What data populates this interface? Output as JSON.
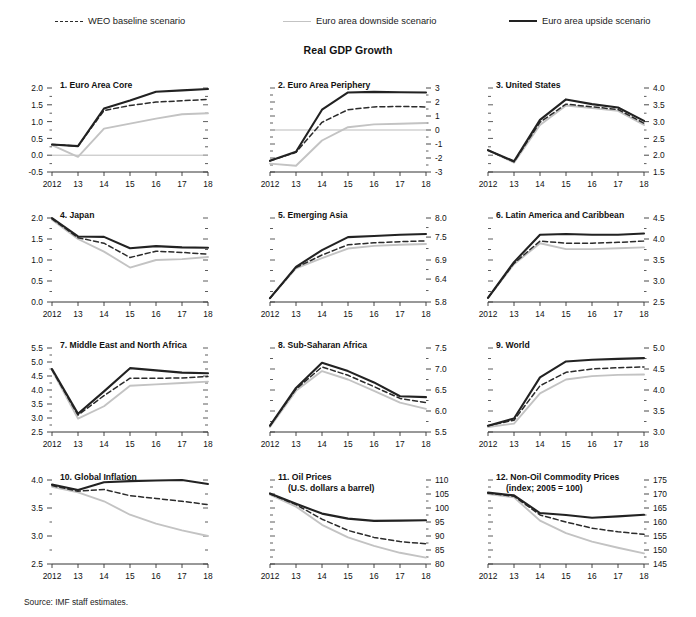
{
  "figure": {
    "title": "Real GDP Growth",
    "source": "Source: IMF staff estimates."
  },
  "legend": {
    "items": [
      {
        "label": "WEO baseline scenario",
        "style": "dashed",
        "color": "#2b2b2b"
      },
      {
        "label": "Euro area downside scenario",
        "style": "solid-light",
        "color": "#c3c3c3"
      },
      {
        "label": "Euro area upside scenario",
        "style": "solid-bold",
        "color": "#222222"
      }
    ]
  },
  "colors": {
    "baseline": "#2b2b2b",
    "downside": "#c3c3c3",
    "upside": "#222222",
    "axis": "#333333",
    "zeroline": "#bbbbbb"
  },
  "chart_data": [
    {
      "type": "line",
      "panel": 1,
      "title": "1. Euro Area Core",
      "subtitle": "",
      "x": [
        "2012",
        "13",
        "14",
        "15",
        "16",
        "17",
        "18"
      ],
      "xlabel": "",
      "ylabel": "",
      "ylim": [
        -0.5,
        2.0
      ],
      "yticks": [
        -0.5,
        0.0,
        0.5,
        1.0,
        1.5,
        2.0
      ],
      "ytick_labels": [
        "-0.5",
        "0.0",
        "0.5",
        "1.0",
        "1.5",
        "2.0"
      ],
      "axis_side": "left",
      "zero_line": 0.0,
      "grid": false,
      "series": [
        {
          "name": "Euro area upside scenario",
          "key": "upside",
          "values": [
            0.32,
            0.27,
            1.39,
            1.63,
            1.89,
            1.93,
            1.97
          ]
        },
        {
          "name": "WEO baseline scenario",
          "key": "baseline",
          "values": [
            0.32,
            0.27,
            1.33,
            1.48,
            1.58,
            1.62,
            1.66
          ]
        },
        {
          "name": "Euro area downside scenario",
          "key": "downside",
          "values": [
            0.3,
            -0.05,
            0.79,
            0.94,
            1.09,
            1.22,
            1.25
          ]
        }
      ]
    },
    {
      "type": "line",
      "panel": 2,
      "title": "2. Euro Area Periphery",
      "subtitle": "",
      "x": [
        "2012",
        "13",
        "14",
        "15",
        "16",
        "17",
        "18"
      ],
      "xlabel": "",
      "ylabel": "",
      "ylim": [
        -3,
        3
      ],
      "yticks": [
        -3,
        -2,
        -1,
        0,
        1,
        2,
        3
      ],
      "ytick_labels": [
        "-3",
        "-2",
        "-1",
        "0",
        "1",
        "2",
        "3"
      ],
      "axis_side": "right",
      "zero_line": 0,
      "grid": false,
      "series": [
        {
          "name": "Euro area upside scenario",
          "key": "upside",
          "values": [
            -2.2,
            -1.55,
            1.45,
            2.68,
            2.72,
            2.7,
            2.68
          ]
        },
        {
          "name": "WEO baseline scenario",
          "key": "baseline",
          "values": [
            -2.2,
            -1.6,
            0.55,
            1.45,
            1.65,
            1.68,
            1.65
          ]
        },
        {
          "name": "Euro area downside scenario",
          "key": "downside",
          "values": [
            -2.4,
            -2.55,
            -0.75,
            0.2,
            0.4,
            0.45,
            0.5
          ]
        }
      ]
    },
    {
      "type": "line",
      "panel": 3,
      "title": "3. United States",
      "subtitle": "",
      "x": [
        "2012",
        "13",
        "14",
        "15",
        "16",
        "17",
        "18"
      ],
      "xlabel": "",
      "ylabel": "",
      "ylim": [
        1.5,
        4.0
      ],
      "yticks": [
        1.5,
        2.0,
        2.5,
        3.0,
        3.5,
        4.0
      ],
      "ytick_labels": [
        "1.5",
        "2.0",
        "2.5",
        "3.0",
        "3.5",
        "4.0"
      ],
      "axis_side": "right",
      "zero_line": null,
      "grid": false,
      "series": [
        {
          "name": "Euro area upside scenario",
          "key": "upside",
          "values": [
            2.15,
            1.82,
            3.05,
            3.66,
            3.52,
            3.42,
            3.02
          ]
        },
        {
          "name": "WEO baseline scenario",
          "key": "baseline",
          "values": [
            2.15,
            1.8,
            2.98,
            3.52,
            3.44,
            3.36,
            2.95
          ]
        },
        {
          "name": "Euro area downside scenario",
          "key": "downside",
          "values": [
            2.15,
            1.78,
            2.9,
            3.48,
            3.4,
            3.32,
            2.9
          ]
        }
      ]
    },
    {
      "type": "line",
      "panel": 4,
      "title": "4. Japan",
      "subtitle": "",
      "x": [
        "2012",
        "13",
        "14",
        "15",
        "16",
        "17",
        "18"
      ],
      "xlabel": "",
      "ylabel": "",
      "ylim": [
        0.0,
        2.0
      ],
      "yticks": [
        0.0,
        0.5,
        1.0,
        1.5,
        2.0
      ],
      "ytick_labels": [
        "0.0",
        "0.5",
        "1.0",
        "1.5",
        "2.0"
      ],
      "axis_side": "left",
      "zero_line": null,
      "grid": false,
      "series": [
        {
          "name": "Euro area upside scenario",
          "key": "upside",
          "values": [
            2.0,
            1.56,
            1.55,
            1.28,
            1.33,
            1.3,
            1.29
          ]
        },
        {
          "name": "WEO baseline scenario",
          "key": "baseline",
          "values": [
            1.98,
            1.53,
            1.4,
            1.06,
            1.21,
            1.18,
            1.14
          ]
        },
        {
          "name": "Euro area downside scenario",
          "key": "downside",
          "values": [
            1.96,
            1.5,
            1.2,
            0.82,
            1.0,
            1.02,
            1.07
          ]
        }
      ]
    },
    {
      "type": "line",
      "panel": 5,
      "title": "5. Emerging Asia",
      "subtitle": "",
      "x": [
        "2012",
        "13",
        "14",
        "15",
        "16",
        "17",
        "18"
      ],
      "xlabel": "",
      "ylabel": "",
      "ylim": [
        5.8,
        8.0
      ],
      "yticks": [
        5.8,
        6.4,
        6.9,
        7.5,
        8.0
      ],
      "ytick_labels": [
        "5.8",
        "6.4",
        "6.9",
        "7.5",
        "8.0"
      ],
      "axis_side": "right",
      "zero_line": null,
      "grid": false,
      "series": [
        {
          "name": "Euro area upside scenario",
          "key": "upside",
          "values": [
            5.9,
            6.72,
            7.16,
            7.5,
            7.53,
            7.56,
            7.58
          ]
        },
        {
          "name": "WEO baseline scenario",
          "key": "baseline",
          "values": [
            5.9,
            6.7,
            7.03,
            7.3,
            7.35,
            7.38,
            7.4
          ]
        },
        {
          "name": "Euro area downside scenario",
          "key": "downside",
          "values": [
            5.9,
            6.68,
            6.95,
            7.2,
            7.27,
            7.3,
            7.32
          ]
        }
      ]
    },
    {
      "type": "line",
      "panel": 6,
      "title": "6. Latin America and Caribbean",
      "subtitle": "",
      "x": [
        "2012",
        "13",
        "14",
        "15",
        "16",
        "17",
        "18"
      ],
      "xlabel": "",
      "ylabel": "",
      "ylim": [
        2.5,
        4.5
      ],
      "yticks": [
        2.5,
        3.0,
        3.5,
        4.0,
        4.5
      ],
      "ytick_labels": [
        "2.5",
        "3.0",
        "3.5",
        "4.0",
        "4.5"
      ],
      "axis_side": "right",
      "zero_line": null,
      "grid": false,
      "series": [
        {
          "name": "Euro area upside scenario",
          "key": "upside",
          "values": [
            2.6,
            3.45,
            4.1,
            4.12,
            4.1,
            4.1,
            4.13
          ]
        },
        {
          "name": "WEO baseline scenario",
          "key": "baseline",
          "values": [
            2.6,
            3.42,
            3.95,
            3.9,
            3.9,
            3.92,
            3.95
          ]
        },
        {
          "name": "Euro area downside scenario",
          "key": "downside",
          "values": [
            2.6,
            3.4,
            3.9,
            3.76,
            3.76,
            3.78,
            3.8
          ]
        }
      ]
    },
    {
      "type": "line",
      "panel": 7,
      "title": "7. Middle East and North Africa",
      "subtitle": "",
      "x": [
        "2012",
        "13",
        "14",
        "15",
        "16",
        "17",
        "18"
      ],
      "xlabel": "",
      "ylabel": "",
      "ylim": [
        2.5,
        5.5
      ],
      "yticks": [
        2.5,
        3.0,
        3.5,
        4.0,
        4.5,
        5.0,
        5.5
      ],
      "ytick_labels": [
        "2.5",
        "3.0",
        "3.5",
        "4.0",
        "4.5",
        "5.0",
        "5.5"
      ],
      "axis_side": "left",
      "zero_line": null,
      "grid": false,
      "series": [
        {
          "name": "Euro area upside scenario",
          "key": "upside",
          "values": [
            4.75,
            3.15,
            3.95,
            4.78,
            4.7,
            4.62,
            4.6
          ]
        },
        {
          "name": "WEO baseline scenario",
          "key": "baseline",
          "values": [
            4.72,
            3.1,
            3.8,
            4.42,
            4.42,
            4.43,
            4.48
          ]
        },
        {
          "name": "Euro area downside scenario",
          "key": "downside",
          "values": [
            4.7,
            2.98,
            3.42,
            4.15,
            4.2,
            4.25,
            4.3
          ]
        }
      ]
    },
    {
      "type": "line",
      "panel": 8,
      "title": "8. Sub-Saharan Africa",
      "subtitle": "",
      "x": [
        "2012",
        "13",
        "14",
        "15",
        "16",
        "17",
        "18"
      ],
      "xlabel": "",
      "ylabel": "",
      "ylim": [
        5.5,
        7.5
      ],
      "yticks": [
        5.5,
        6.0,
        6.5,
        7.0,
        7.5
      ],
      "ytick_labels": [
        "5.5",
        "6.0",
        "6.5",
        "7.0",
        "7.5"
      ],
      "axis_side": "right",
      "zero_line": null,
      "grid": false,
      "series": [
        {
          "name": "Euro area upside scenario",
          "key": "upside",
          "values": [
            5.65,
            6.55,
            7.15,
            6.95,
            6.68,
            6.35,
            6.33
          ]
        },
        {
          "name": "WEO baseline scenario",
          "key": "baseline",
          "values": [
            5.65,
            6.52,
            7.05,
            6.85,
            6.58,
            6.3,
            6.2
          ]
        },
        {
          "name": "Euro area downside scenario",
          "key": "downside",
          "values": [
            5.62,
            6.48,
            6.95,
            6.75,
            6.48,
            6.2,
            6.05
          ]
        }
      ]
    },
    {
      "type": "line",
      "panel": 9,
      "title": "9. World",
      "subtitle": "",
      "x": [
        "2012",
        "13",
        "14",
        "15",
        "16",
        "17",
        "18"
      ],
      "xlabel": "",
      "ylabel": "",
      "ylim": [
        3.0,
        5.0
      ],
      "yticks": [
        3.0,
        3.5,
        4.0,
        4.5,
        5.0
      ],
      "ytick_labels": [
        "3.0",
        "3.5",
        "4.0",
        "4.5",
        "5.0"
      ],
      "axis_side": "right",
      "zero_line": null,
      "grid": false,
      "series": [
        {
          "name": "Euro area upside scenario",
          "key": "upside",
          "values": [
            3.15,
            3.32,
            4.3,
            4.68,
            4.72,
            4.74,
            4.76
          ]
        },
        {
          "name": "WEO baseline scenario",
          "key": "baseline",
          "values": [
            3.15,
            3.28,
            4.1,
            4.42,
            4.5,
            4.53,
            4.55
          ]
        },
        {
          "name": "Euro area downside scenario",
          "key": "downside",
          "values": [
            3.12,
            3.2,
            3.92,
            4.25,
            4.33,
            4.36,
            4.37
          ]
        }
      ]
    },
    {
      "type": "line",
      "panel": 10,
      "title": "10. Global Inflation",
      "subtitle": "",
      "x": [
        "2012",
        "13",
        "14",
        "15",
        "16",
        "17",
        "18"
      ],
      "xlabel": "",
      "ylabel": "",
      "ylim": [
        2.5,
        4.0
      ],
      "yticks": [
        2.5,
        3.0,
        3.5,
        4.0
      ],
      "ytick_labels": [
        "2.5",
        "3.0",
        "3.5",
        "4.0"
      ],
      "axis_side": "left",
      "zero_line": null,
      "grid": false,
      "series": [
        {
          "name": "Euro area upside scenario",
          "key": "upside",
          "values": [
            3.92,
            3.82,
            3.96,
            3.98,
            3.99,
            4.0,
            3.93
          ]
        },
        {
          "name": "WEO baseline scenario",
          "key": "baseline",
          "values": [
            3.9,
            3.8,
            3.83,
            3.72,
            3.67,
            3.62,
            3.56
          ]
        },
        {
          "name": "Euro area downside scenario",
          "key": "downside",
          "values": [
            3.88,
            3.78,
            3.62,
            3.38,
            3.22,
            3.1,
            3.0
          ]
        }
      ]
    },
    {
      "type": "line",
      "panel": 11,
      "title": "11. Oil Prices",
      "subtitle": "(U.S. dollars a barrel)",
      "x": [
        "2012",
        "13",
        "14",
        "15",
        "16",
        "17",
        "18"
      ],
      "xlabel": "",
      "ylabel": "",
      "ylim": [
        80,
        110
      ],
      "yticks": [
        80,
        85,
        90,
        95,
        100,
        105,
        110
      ],
      "ytick_labels": [
        "80",
        "85",
        "90",
        "95",
        "100",
        "105",
        "110"
      ],
      "axis_side": "right",
      "zero_line": null,
      "grid": false,
      "series": [
        {
          "name": "Euro area upside scenario",
          "key": "upside",
          "values": [
            105.2,
            101.5,
            98.0,
            96.2,
            95.4,
            95.5,
            95.6
          ]
        },
        {
          "name": "WEO baseline scenario",
          "key": "baseline",
          "values": [
            105.0,
            101.2,
            96.0,
            92.0,
            89.5,
            88.0,
            87.2
          ]
        },
        {
          "name": "Euro area downside scenario",
          "key": "downside",
          "values": [
            104.8,
            100.5,
            94.0,
            89.5,
            86.5,
            84.0,
            82.3
          ]
        }
      ]
    },
    {
      "type": "line",
      "panel": 12,
      "title": "12. Non-Oil Commodity Prices",
      "subtitle": "(index; 2005 = 100)",
      "x": [
        "2012",
        "13",
        "14",
        "15",
        "16",
        "17",
        "18"
      ],
      "xlabel": "",
      "ylabel": "",
      "ylim": [
        145,
        175
      ],
      "yticks": [
        145,
        150,
        155,
        160,
        165,
        170,
        175
      ],
      "ytick_labels": [
        "145",
        "150",
        "155",
        "160",
        "165",
        "170",
        "175"
      ],
      "axis_side": "right",
      "zero_line": null,
      "grid": false,
      "series": [
        {
          "name": "Euro area upside scenario",
          "key": "upside",
          "values": [
            170.5,
            169.5,
            163.2,
            162.5,
            161.5,
            162.0,
            162.6
          ]
        },
        {
          "name": "WEO baseline scenario",
          "key": "baseline",
          "values": [
            170.3,
            169.2,
            162.5,
            160.0,
            157.8,
            156.5,
            155.6
          ]
        },
        {
          "name": "Euro area downside scenario",
          "key": "downside",
          "values": [
            170.0,
            168.8,
            160.5,
            156.0,
            153.0,
            150.8,
            148.8
          ]
        }
      ]
    }
  ]
}
